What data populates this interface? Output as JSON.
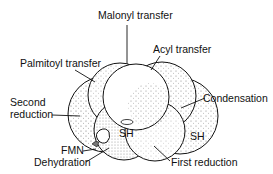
{
  "diagram": {
    "labels": {
      "malonyl": "Malonyl transfer",
      "acyl": "Acyl transfer",
      "palmitoyl": "Palmitoyl transfer",
      "second_reduction_1": "Second",
      "second_reduction_2": "reduction",
      "condensation": "Condensation",
      "sh_left": "SH",
      "sh_right": "SH",
      "fmn": "FMN",
      "dehydration": "Dehydration",
      "first_reduction": "First reduction"
    },
    "colors": {
      "stroke": "#111111",
      "fill": "#ffffff",
      "stipple": "#333333"
    }
  }
}
